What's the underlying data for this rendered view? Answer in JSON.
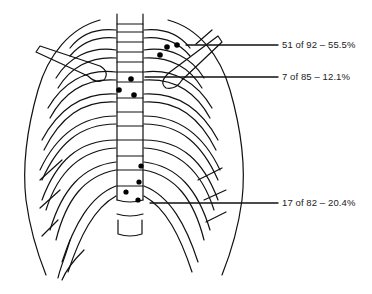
{
  "figure": {
    "line_color": "#111111",
    "background": "#ffffff"
  },
  "annotations": [
    {
      "id": "clavicle-region",
      "text": "51 of 92 – 55.5%",
      "count": 51,
      "total": 92,
      "percent": 55.5
    },
    {
      "id": "manubrium-region",
      "text": "7 of 85 – 12.1%",
      "count": 7,
      "total": 85,
      "percent": 12.1
    },
    {
      "id": "lower-sternum-region",
      "text": "17 of 82 – 20.4%",
      "count": 17,
      "total": 82,
      "percent": 20.4
    }
  ]
}
